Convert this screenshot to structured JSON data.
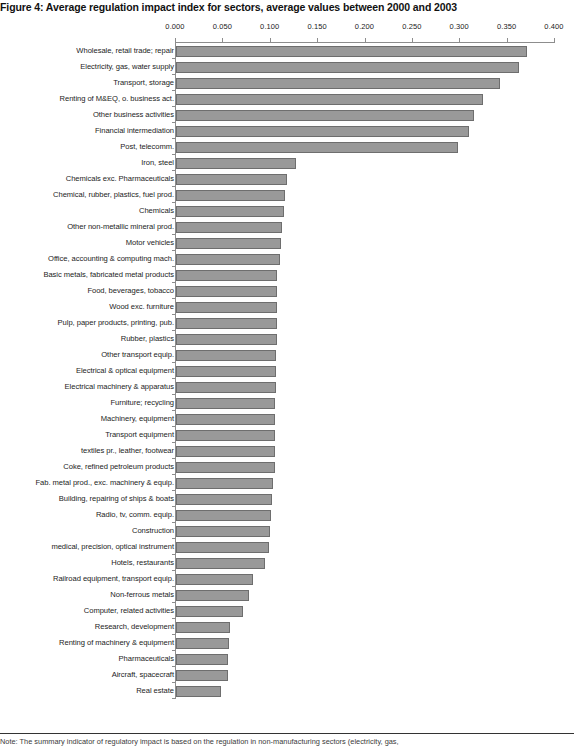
{
  "figure": {
    "title": "Figure 4: Average regulation impact index for sectors, average values between 2000 and 2003",
    "note": "Note: The summary indicator of regulatory impact is based on the regulation in non-manufacturing sectors (electricity, gas,"
  },
  "chart_data": {
    "type": "bar",
    "orientation": "horizontal",
    "title": "Figure 4: Average regulation impact index for sectors, average values between 2000 and 2003",
    "xlabel": "",
    "ylabel": "",
    "xlim": [
      0.0,
      0.4
    ],
    "grid": false,
    "legend": null,
    "xticks": [
      "0.000",
      "0.050",
      "0.100",
      "0.150",
      "0.200",
      "0.250",
      "0.300",
      "0.350",
      "0.400"
    ],
    "xtick_values": [
      0.0,
      0.05,
      0.1,
      0.15,
      0.2,
      0.25,
      0.3,
      0.35,
      0.4
    ],
    "bar_color": "#999999",
    "bar_border_color": "#6e6e6e",
    "categories": [
      "Wholesale, retail trade; repair",
      "Electricity, gas, water supply",
      "Transport, storage",
      "Renting of M&EQ, o. business act.",
      "Other business activities",
      "Financial intermediation",
      "Post, telecomm.",
      "Iron, steel",
      "Chemicals exc. Pharmaceuticals",
      "Chemical, rubber, plastics, fuel prod.",
      "Chemicals",
      "Other non-metallic mineral prod.",
      "Motor vehicles",
      "Office, accounting & computing mach.",
      "Basic metals, fabricated metal products",
      "Food, beverages, tobacco",
      "Wood exc. furniture",
      "Pulp, paper products, printing, pub.",
      "Rubber, plastics",
      "Other transport equip.",
      "Electrical & optical equipment",
      "Electrical machinery & apparatus",
      "Furniture; recycling",
      "Machinery, equipment",
      "Transport equipment",
      "textiles pr., leather, footwear",
      "Coke, refined petroleum products",
      "Fab. metal prod., exc. machinery & equip.",
      "Building, repairing of ships & boats",
      "Radio, tv, comm. equip.",
      "Construction",
      "medical, precision, optical instrument",
      "Hotels, restaurants",
      "Railroad equipment, transport equip.",
      "Non-ferrous metals",
      "Computer, related activities",
      "Research, development",
      "Renting of machinery & equipment",
      "Pharmaceuticals",
      "Aircraft, spacecraft",
      "Real estate"
    ],
    "values": [
      0.37,
      0.362,
      0.342,
      0.324,
      0.314,
      0.309,
      0.298,
      0.127,
      0.117,
      0.115,
      0.114,
      0.112,
      0.111,
      0.11,
      0.107,
      0.107,
      0.107,
      0.107,
      0.107,
      0.106,
      0.106,
      0.106,
      0.105,
      0.105,
      0.105,
      0.105,
      0.104,
      0.102,
      0.101,
      0.1,
      0.099,
      0.098,
      0.094,
      0.081,
      0.077,
      0.071,
      0.057,
      0.056,
      0.055,
      0.055,
      0.047
    ]
  }
}
